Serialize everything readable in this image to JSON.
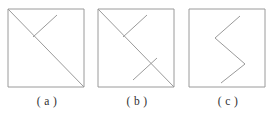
{
  "page": {
    "background_color": "#ffffff",
    "stroke_color": "#9a9a9a",
    "caption_color": "#2f2f2f"
  },
  "figures": [
    {
      "id": "a",
      "caption": "( a )",
      "description": "square with main diagonal from top-left to bottom-right plus one short segment from top edge down-left to the diagonal",
      "frame": {
        "x": 1,
        "y": 1,
        "width": 76,
        "height": 78
      },
      "paths": [
        {
          "name": "square-outline",
          "points": "1,1 77,1 77,79 1,79 1,1"
        },
        {
          "name": "main-diagonal",
          "points": "1,1 77,79"
        },
        {
          "name": "short-segment",
          "points": "50,7 26,29"
        }
      ]
    },
    {
      "id": "b",
      "caption": "( b )",
      "description": "square with main diagonal from top-left to bottom-right plus two short segments forming zigzag crossings",
      "frame": {
        "x": 1,
        "y": 1,
        "width": 76,
        "height": 78
      },
      "paths": [
        {
          "name": "square-outline",
          "points": "1,1 77,1 77,79 1,79 1,1"
        },
        {
          "name": "main-diagonal",
          "points": "1,1 77,79"
        },
        {
          "name": "upper-segment",
          "points": "50,7 26,29"
        },
        {
          "name": "lower-segment",
          "points": "36,72 60,50"
        }
      ]
    },
    {
      "id": "c",
      "caption": "( c )",
      "description": "square containing only a zigzag polyline with no full diagonal",
      "frame": {
        "x": 1,
        "y": 1,
        "width": 76,
        "height": 78
      },
      "paths": [
        {
          "name": "square-outline",
          "points": "1,1 77,1 77,79 1,79 1,1"
        },
        {
          "name": "zigzag-polyline",
          "points": "52,8 27,30 57,56 33,75"
        }
      ]
    }
  ]
}
